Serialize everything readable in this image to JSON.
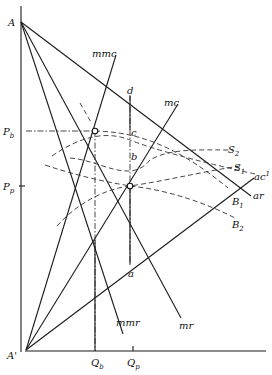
{
  "diagram": {
    "points": {
      "A": "A",
      "A_prime": "A'",
      "d": "d",
      "c": "c",
      "b": "b",
      "a": "a"
    },
    "axis_labels": {
      "P_b": {
        "main": "P",
        "sub": "b"
      },
      "P_p": {
        "main": "P",
        "sub": "p"
      },
      "Q_b": {
        "main": "Q",
        "sub": "b"
      },
      "Q_p": {
        "main": "Q",
        "sub": "p"
      }
    },
    "curve_labels": {
      "mmc": "mmc",
      "mc": "mc",
      "mr": "mr",
      "mmr": "mmr",
      "ar": "ar",
      "ac": "ac",
      "ac_sup": "1",
      "S2": {
        "main": "S",
        "sub": "2"
      },
      "S1": {
        "main": "S",
        "sub": "1"
      },
      "B1": {
        "main": "B",
        "sub": "1"
      },
      "B2": {
        "main": "B",
        "sub": "2"
      }
    }
  }
}
